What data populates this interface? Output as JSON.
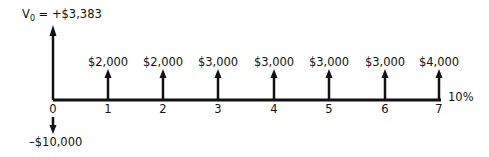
{
  "diagram": {
    "type": "cash-flow-timeline",
    "present_value": {
      "symbol": "V",
      "subscript": "0",
      "equals": " = ",
      "value": "+$3,383"
    },
    "initial_outflow": {
      "period": 0,
      "label": "–$10,000",
      "amount": -10000
    },
    "rate_label": "10%",
    "periods": [
      {
        "index": "0",
        "cash_flow": null,
        "label": ""
      },
      {
        "index": "1",
        "cash_flow": 2000,
        "label": "$2,000"
      },
      {
        "index": "2",
        "cash_flow": 2000,
        "label": "$2,000"
      },
      {
        "index": "3",
        "cash_flow": 3000,
        "label": "$3,000"
      },
      {
        "index": "4",
        "cash_flow": 3000,
        "label": "$3,000"
      },
      {
        "index": "5",
        "cash_flow": 3000,
        "label": "$3,000"
      },
      {
        "index": "6",
        "cash_flow": 3000,
        "label": "$3,000"
      },
      {
        "index": "7",
        "cash_flow": 4000,
        "label": "$4,000"
      }
    ],
    "colors": {
      "line": "#111111",
      "text": "#111111",
      "background": "#ffffff"
    }
  }
}
